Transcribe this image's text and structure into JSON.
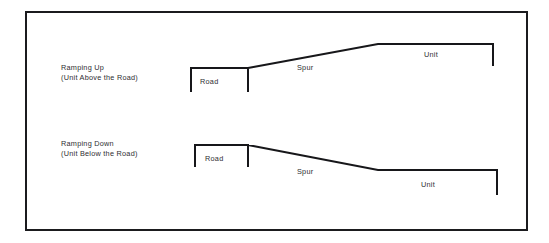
{
  "figure": {
    "background_color": "#ffffff",
    "line_color": "#17171a",
    "text_color": "#2e2e32",
    "border": {
      "name": "outer-frame",
      "x": 26,
      "y": 12,
      "width": 501,
      "height": 218
    }
  },
  "diagrams": [
    {
      "id": "ramping-up",
      "caption_line1": "Ramping Up",
      "caption_line2": "(Unit Above the Road)",
      "caption_x": 61,
      "caption_y1": 70,
      "caption_y2": 80,
      "road_label": "Road",
      "road_label_x": 200,
      "road_label_y": 84,
      "spur_label": "Spur",
      "spur_label_x": 297,
      "spur_label_y": 70,
      "unit_label": "Unit",
      "unit_label_x": 424,
      "unit_label_y": 57,
      "profile_path": "M 191,92 L 191,68 L 248,68 L 248,92 M 248,68 L 378,44 L 493,44 L 493,66",
      "geometry": {
        "road_left_x": 191,
        "road_right_x": 248,
        "road_y": 68,
        "road_tick_bottom_y": 92,
        "spur_start": [
          248,
          68
        ],
        "spur_end": [
          378,
          44
        ],
        "unit_left_x": 378,
        "unit_right_x": 493,
        "unit_y": 44,
        "unit_tick_bottom_y": 66
      }
    },
    {
      "id": "ramping-down",
      "caption_line1": "Ramping Down",
      "caption_line2": "(Unit Below the Road)",
      "caption_x": 61,
      "caption_y1": 146,
      "caption_y2": 156,
      "road_label": "Road",
      "road_label_x": 205,
      "road_label_y": 161,
      "spur_label": "Spur",
      "spur_label_x": 297,
      "spur_label_y": 174,
      "unit_label": "Unit",
      "unit_label_x": 421,
      "unit_label_y": 187,
      "profile_path": "M 195,167 L 195,145 L 248,145 L 248,167 M 248,145 L 378,170 L 497,170 L 497,195",
      "geometry": {
        "road_left_x": 195,
        "road_right_x": 248,
        "road_y": 145,
        "road_tick_bottom_y": 167,
        "spur_start": [
          248,
          145
        ],
        "spur_end": [
          378,
          170
        ],
        "unit_left_x": 378,
        "unit_right_x": 497,
        "unit_y": 170,
        "unit_tick_bottom_y": 195
      }
    }
  ]
}
